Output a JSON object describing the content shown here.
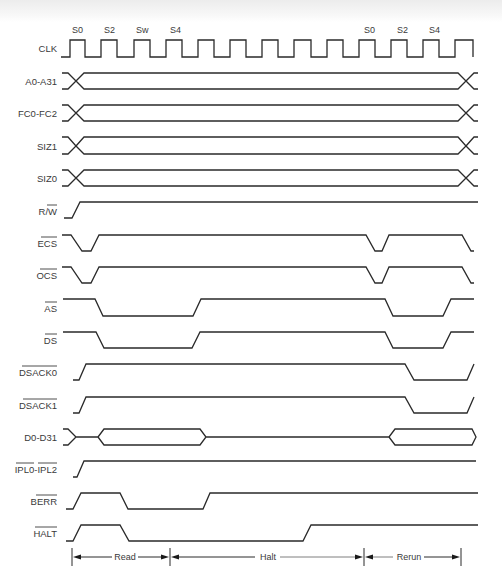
{
  "diagram": {
    "type": "timing-diagram",
    "state_labels": [
      {
        "text": "S0",
        "x": 78
      },
      {
        "text": "S2",
        "x": 110
      },
      {
        "text": "Sw",
        "x": 142
      },
      {
        "text": "S4",
        "x": 174
      },
      {
        "text": "S0",
        "x": 365
      },
      {
        "text": "S2",
        "x": 398
      },
      {
        "text": "S4",
        "x": 430
      }
    ],
    "signals": [
      {
        "name": "CLK",
        "overbar": false
      },
      {
        "name": "A0-A31",
        "overbar": false
      },
      {
        "name": "FC0-FC2",
        "overbar": false
      },
      {
        "name": "SIZ1",
        "overbar": false
      },
      {
        "name": "SIZ0",
        "overbar": false
      },
      {
        "name": "R/W",
        "prefix": "R/",
        "bar_part": "W"
      },
      {
        "name": "ECS",
        "overbar": true
      },
      {
        "name": "OCS",
        "overbar": true
      },
      {
        "name": "AS",
        "overbar": true
      },
      {
        "name": "DS",
        "overbar": true
      },
      {
        "name": "DSACK0",
        "overbar": true
      },
      {
        "name": "DSACK1",
        "overbar": true
      },
      {
        "name": "D0-D31",
        "overbar": false
      },
      {
        "name": "IPL0-IPL2",
        "part1": "IPL0",
        "sep": "-",
        "part2": "IPL2",
        "overbar": true
      },
      {
        "name": "BERR",
        "overbar": true
      },
      {
        "name": "HALT",
        "overbar": true
      }
    ],
    "phases": [
      {
        "label": "Read",
        "from_x": 72,
        "to_x": 170
      },
      {
        "label": "Halt",
        "from_x": 170,
        "to_x": 364
      },
      {
        "label": "Rerun",
        "from_x": 364,
        "to_x": 461
      }
    ],
    "colors": {
      "line": "#2a2a2a",
      "text": "#3a3a3a",
      "background": "#ffffff"
    }
  }
}
